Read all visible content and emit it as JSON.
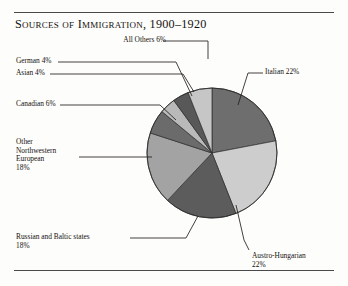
{
  "figure": {
    "title": "Sources of Immigration, 1900–1920",
    "rule_color": "#4a4a4a",
    "background": "#fdfdfb"
  },
  "chart_data": {
    "type": "pie",
    "title": "Sources of Immigration, 1900–1920",
    "xlabel": "",
    "ylabel": "",
    "total": 100,
    "units": "percent",
    "legend_position": "callout-labels",
    "grid": false,
    "center": {
      "x": 212,
      "y": 153
    },
    "radius": 65,
    "start_angle_deg": -90,
    "categories": [
      "Italian",
      "Austro-Hungarian",
      "Russian and Baltic states",
      "Other Northwestern European",
      "Canadian",
      "Asian",
      "German",
      "All Others"
    ],
    "values": [
      22,
      22,
      18,
      18,
      6,
      4,
      4,
      6
    ],
    "slices": [
      {
        "label": "Italian",
        "value": 22,
        "value_text": "22%",
        "color": "#6e6e6e"
      },
      {
        "label": "Austro-Hungarian",
        "value": 22,
        "value_text": "22%",
        "color": "#cdcdcd"
      },
      {
        "label": "Russian and Baltic states",
        "value": 18,
        "value_text": "18%",
        "color": "#5c5c5c"
      },
      {
        "label": "Other Northwestern European",
        "value": 18,
        "value_text": "18%",
        "color": "#a3a3a3"
      },
      {
        "label": "Canadian",
        "value": 6,
        "value_text": "6%",
        "color": "#6b6b6b"
      },
      {
        "label": "Asian",
        "value": 4,
        "value_text": "4%",
        "color": "#b9b9b9"
      },
      {
        "label": "German",
        "value": 4,
        "value_text": "4%",
        "color": "#585858"
      },
      {
        "label": "All Others",
        "value": 6,
        "value_text": "6%",
        "color": "#c6c6c6"
      }
    ]
  },
  "callouts": {
    "all_others": "All Others 6%",
    "italian": "Italian 22%",
    "austro_hungarian": "Austro-Hungarian\n22%",
    "russian_baltic": "Russian and Baltic states\n18%",
    "other_nw_european": "Other\nNorthwestern\nEuropean\n18%",
    "canadian": "Canadian 6%",
    "asian": "Asian 4%",
    "german": "German  4%"
  }
}
